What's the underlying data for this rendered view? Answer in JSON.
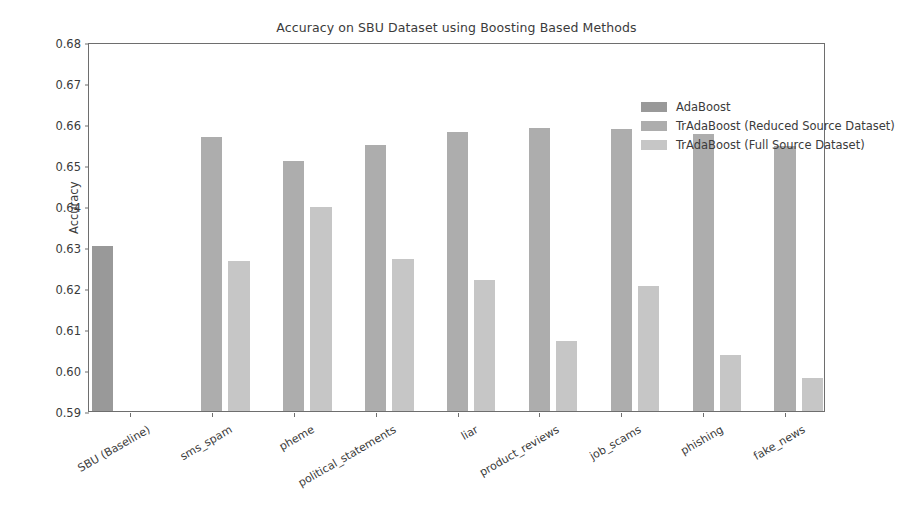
{
  "chart_data": {
    "type": "bar",
    "title": "Accuracy on SBU Dataset using Boosting Based Methods",
    "xlabel": "",
    "ylabel": "Accuracy",
    "ylim": [
      0.59,
      0.68
    ],
    "yticks": [
      "0.59",
      "0.60",
      "0.61",
      "0.62",
      "0.63",
      "0.64",
      "0.65",
      "0.66",
      "0.67",
      "0.68"
    ],
    "grid": false,
    "legend_position": "upper right",
    "categories": [
      "SBU (Baseline)",
      "sms_spam",
      "pheme",
      "political_statements",
      "liar",
      "product_reviews",
      "job_scams",
      "phishing",
      "fake_news"
    ],
    "series": [
      {
        "name": "AdaBoost",
        "color": "#999999",
        "values": [
          0.6303,
          null,
          null,
          null,
          null,
          null,
          null,
          null,
          null
        ]
      },
      {
        "name": "TrAdaBoost (Reduced Source Dataset)",
        "color": "#adadad",
        "values": [
          null,
          0.6568,
          0.6511,
          0.6549,
          0.6581,
          0.6591,
          0.6587,
          0.6576,
          0.6547
        ]
      },
      {
        "name": "TrAdaBoost (Full Source Dataset)",
        "color": "#c6c6c6",
        "values": [
          null,
          0.6266,
          0.6398,
          0.627,
          0.622,
          0.6071,
          0.6204,
          0.6036,
          0.598
        ]
      }
    ]
  }
}
